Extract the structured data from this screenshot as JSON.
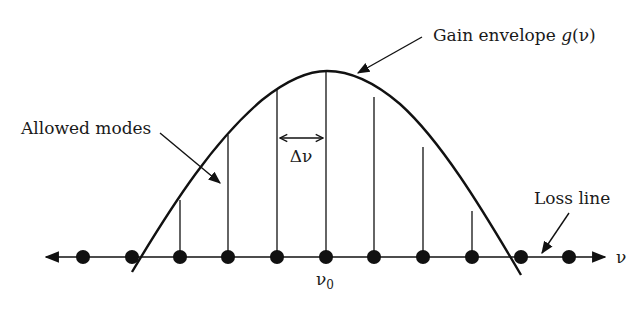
{
  "diagram": {
    "colors": {
      "ink": "#111111",
      "background": "#ffffff"
    },
    "labels": {
      "gain_envelope": "Gain envelope ",
      "gain_symbol": "g",
      "gain_arg": "(ν)",
      "allowed_modes": "Allowed modes",
      "loss_line": "Loss line",
      "delta_nu": "Δν",
      "axis_label": "ν",
      "center_freq": "ν",
      "center_freq_sub": "0"
    },
    "axis": {
      "y": 257,
      "x_start": 44,
      "x_end": 607,
      "arrows": "both"
    },
    "gain_curve": {
      "peak_x": 327,
      "peak_y": 71,
      "left_end": [
        132,
        272
      ],
      "right_end": [
        521,
        275
      ]
    },
    "modes": [
      {
        "x": 83,
        "line_top": null
      },
      {
        "x": 132,
        "line_top": null
      },
      {
        "x": 180,
        "line_top": 200
      },
      {
        "x": 228,
        "line_top": 135
      },
      {
        "x": 277,
        "line_top": 89
      },
      {
        "x": 326,
        "line_top": 71
      },
      {
        "x": 374,
        "line_top": 97
      },
      {
        "x": 423,
        "line_top": 147
      },
      {
        "x": 472,
        "line_top": 211
      },
      {
        "x": 521,
        "line_top": null
      },
      {
        "x": 569,
        "line_top": null
      }
    ],
    "mode_spacing_marker": {
      "from_x": 280,
      "to_x": 323,
      "y": 138
    }
  }
}
